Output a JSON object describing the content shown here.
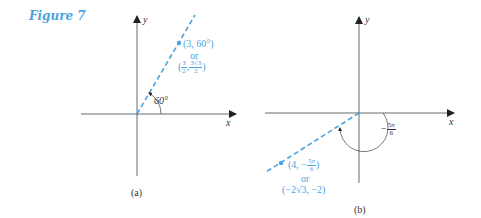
{
  "figure": {
    "title": "Figure 7",
    "accent_color": "#4aa3df",
    "axis_color": "#333333"
  },
  "panel_a": {
    "caption": "(a)",
    "x_axis_label": "x",
    "y_axis_label": "y",
    "angle_label": "60°",
    "point_polar": "(3, 60°)",
    "or_label": "or",
    "point_rect_open": "(",
    "point_rect_x_num": "3",
    "point_rect_x_den": "2",
    "point_rect_sep": ",",
    "point_rect_y_num": "3√3",
    "point_rect_y_den": "2",
    "point_rect_close": ")"
  },
  "panel_b": {
    "caption": "(b)",
    "x_axis_label": "x",
    "y_axis_label": "y",
    "angle_sign": "−",
    "angle_num": "5π",
    "angle_den": "6",
    "point_polar_open": "(4, −",
    "point_polar_num": "5π",
    "point_polar_den": "6",
    "point_polar_close": ")",
    "or_label": "or",
    "point_rect": "(−2√3, −2)"
  }
}
